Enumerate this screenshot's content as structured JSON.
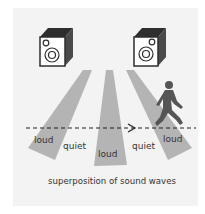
{
  "figure": {
    "caption": "superposition of sound waves",
    "labels": {
      "loud_1": "loud",
      "quiet_1": "quiet",
      "loud_2": "loud",
      "quiet_2": "quiet",
      "loud_3": "loud"
    },
    "elements": {
      "speakers": [
        "speaker-left",
        "speaker-right"
      ],
      "beams": 3,
      "listener": "walking-person-icon",
      "path": "dashed-arrow"
    },
    "colors": {
      "panel": "#f3f3f3",
      "beam": "#b4b4b4",
      "speaker_dark": "#3a3a3a",
      "speaker_face": "#ffffff",
      "person": "#555555",
      "text": "#333333"
    }
  }
}
